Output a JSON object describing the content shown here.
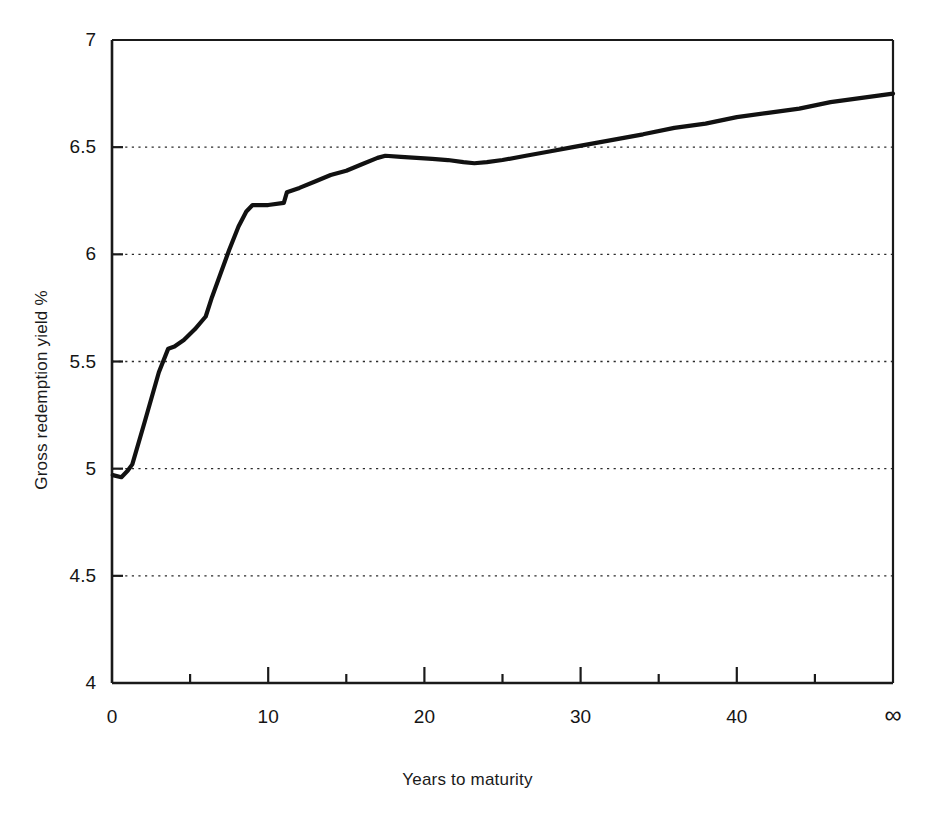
{
  "chart_data": {
    "type": "line",
    "title": "",
    "xlabel": "Years to maturity",
    "ylabel": "Gross redemption yield %",
    "xlim": [
      0,
      50
    ],
    "ylim": [
      4,
      7
    ],
    "grid": true,
    "grid_axis": "y",
    "legend": "none",
    "xticks": [
      0,
      10,
      20,
      30,
      40,
      50
    ],
    "xticklabels": [
      "0",
      "10",
      "20",
      "30",
      "40",
      "∞"
    ],
    "xminorticks": [
      5,
      15,
      25,
      35,
      45
    ],
    "yticks": [
      4,
      4.5,
      5,
      5.5,
      6,
      6.5,
      7
    ],
    "yticklabels": [
      "4",
      "4.5",
      "5",
      "5.5",
      "6",
      "6.5",
      "7"
    ],
    "series": [
      {
        "name": "Gross redemption yield",
        "color": "#111111",
        "x": [
          0.05,
          0.6,
          1.0,
          1.3,
          2.1,
          3.0,
          3.6,
          4.0,
          4.6,
          5.3,
          6.0,
          6.4,
          6.9,
          7.5,
          8.1,
          8.6,
          9.0,
          10.0,
          11.0,
          11.2,
          12.0,
          13.0,
          14.0,
          15.0,
          16.0,
          17.0,
          17.5,
          18.5,
          19.5,
          20.5,
          21.5,
          22.5,
          23.2,
          24.0,
          25.0,
          26.5,
          28.0,
          29.5,
          31.0,
          32.5,
          34.0,
          36.0,
          38.0,
          40.0,
          42.0,
          44.0,
          46.0,
          48.0,
          50.0
        ],
        "y": [
          4.97,
          4.96,
          4.99,
          5.02,
          5.22,
          5.45,
          5.56,
          5.57,
          5.6,
          5.65,
          5.71,
          5.8,
          5.9,
          6.02,
          6.13,
          6.2,
          6.23,
          6.23,
          6.24,
          6.29,
          6.31,
          6.34,
          6.37,
          6.39,
          6.42,
          6.45,
          6.46,
          6.455,
          6.45,
          6.445,
          6.44,
          6.43,
          6.425,
          6.43,
          6.44,
          6.46,
          6.48,
          6.5,
          6.52,
          6.54,
          6.56,
          6.59,
          6.61,
          6.64,
          6.66,
          6.68,
          6.71,
          6.73,
          6.75
        ]
      }
    ],
    "annotations": [],
    "notable_values": {
      "start_yield": 4.97,
      "first_kink_years": 3.6,
      "first_kink_yield": 5.57,
      "shelf_years": 9.0,
      "shelf_yield": 6.23,
      "hump_peak_years": 17.5,
      "hump_peak_yield": 6.46,
      "local_min_years": 23.2,
      "local_min_yield": 6.425,
      "crosses_65_years": 31.0,
      "end_yield": 6.75
    }
  },
  "axis": {
    "y_title": "Gross redemption yield %",
    "x_title": "Years to maturity"
  }
}
